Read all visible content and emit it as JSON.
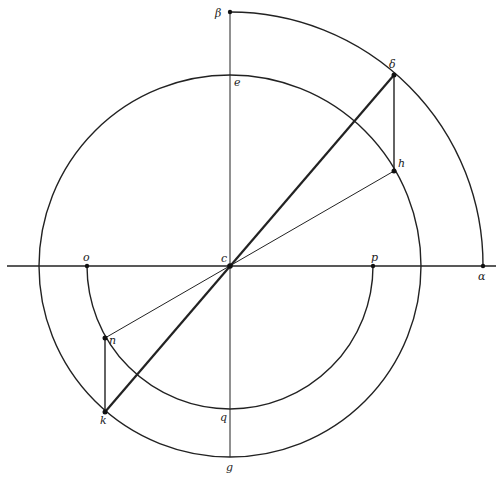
{
  "diagram": {
    "type": "geometric-construction",
    "center": {
      "name": "c",
      "x": 230,
      "y": 266
    },
    "circles": [
      {
        "name": "main-circle",
        "r": 191
      },
      {
        "name": "inner-lower-semicircle",
        "r": 143,
        "span": "lower half from o to p"
      },
      {
        "name": "outer-quarter-arc",
        "r": 253,
        "span": "first quadrant from beta to alpha"
      }
    ],
    "points": {
      "alpha": {
        "label": "α",
        "x": 483,
        "y": 266
      },
      "beta": {
        "label": "β",
        "x": 230,
        "y": 12
      },
      "delta": {
        "label": "δ",
        "x": 394,
        "y": 75
      },
      "e": {
        "label": "e",
        "x": 230,
        "y": 75
      },
      "h": {
        "label": "h",
        "x": 394,
        "y": 171
      },
      "o": {
        "label": "o",
        "x": 87,
        "y": 266
      },
      "c": {
        "label": "c",
        "x": 230,
        "y": 266
      },
      "p": {
        "label": "p",
        "x": 373,
        "y": 266
      },
      "n": {
        "label": "n",
        "x": 105,
        "y": 338
      },
      "k": {
        "label": "k",
        "x": 105,
        "y": 412
      },
      "q": {
        "label": "q",
        "x": 230,
        "y": 409
      },
      "g": {
        "label": "g",
        "x": 230,
        "y": 457
      }
    },
    "segments": [
      {
        "from": "k",
        "to": "delta",
        "weight": "thick",
        "note": "line through c"
      },
      {
        "from": "n",
        "to": "h",
        "weight": "thin",
        "note": "line through c"
      },
      {
        "from": "delta",
        "to": "h",
        "weight": "mid"
      },
      {
        "from": "n",
        "to": "k",
        "weight": "mid"
      },
      {
        "from": "beta",
        "to": "g",
        "weight": "thin",
        "note": "vertical axis"
      },
      {
        "from": "left-edge",
        "to": "right-edge",
        "weight": "mid",
        "note": "horizontal axis through o, c, p, alpha"
      }
    ]
  }
}
